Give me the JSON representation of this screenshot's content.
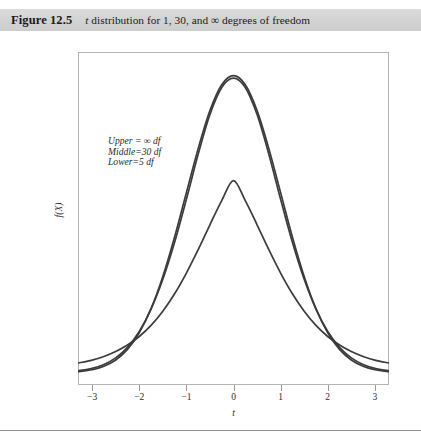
{
  "header": {
    "figure_number": "Figure 12.5",
    "caption_prefix": "t",
    "caption_rest": " distribution for 1, 30, and ∞ degrees of freedom"
  },
  "annotation": {
    "line1": "Upper = ∞ df",
    "line2": "Middle=30 df",
    "line3": "Lower=5 df"
  },
  "axes": {
    "x_title": "t",
    "y_title": "f(X)",
    "x_ticks": [
      "−3",
      "−2",
      "−1",
      "0",
      "1",
      "2",
      "3"
    ]
  },
  "colors": {
    "header_band": "#d2d2d2",
    "curve": "#3c3c3c",
    "frame": "#b4b4b4",
    "footer_rule": "#8e8e8e"
  },
  "chart_data": {
    "type": "line",
    "title": "t distribution for 1, 30, and ∞ degrees of freedom",
    "xlabel": "t",
    "ylabel": "f(X)",
    "xlim": [
      -3.3,
      3.3
    ],
    "ylim": [
      0,
      0.42
    ],
    "grid": false,
    "legend": "annotation-inside-plot",
    "x_ticks": [
      -3,
      -2,
      -1,
      0,
      1,
      2,
      3
    ],
    "series": [
      {
        "name": "Upper = ∞ df",
        "df": "infinity",
        "peak_value": 0.399,
        "x": [
          -3.3,
          -3,
          -2.75,
          -2.5,
          -2.25,
          -2,
          -1.75,
          -1.5,
          -1.25,
          -1,
          -0.75,
          -0.5,
          -0.25,
          0,
          0.25,
          0.5,
          0.75,
          1,
          1.25,
          1.5,
          1.75,
          2,
          2.25,
          2.5,
          2.75,
          3,
          3.3
        ],
        "values": [
          0.0017,
          0.0044,
          0.0091,
          0.0175,
          0.0317,
          0.054,
          0.0863,
          0.1295,
          0.1826,
          0.242,
          0.3011,
          0.3521,
          0.3867,
          0.3989,
          0.3867,
          0.3521,
          0.3011,
          0.242,
          0.1826,
          0.1295,
          0.0863,
          0.054,
          0.0317,
          0.0175,
          0.0091,
          0.0044,
          0.0017
        ]
      },
      {
        "name": "Middle=30 df",
        "df": 30,
        "peak_value": 0.3956,
        "x": [
          -3.3,
          -3,
          -2.75,
          -2.5,
          -2.25,
          -2,
          -1.75,
          -1.5,
          -1.25,
          -1,
          -0.75,
          -0.5,
          -0.25,
          0,
          0.25,
          0.5,
          0.75,
          1,
          1.25,
          1.5,
          1.75,
          2,
          2.25,
          2.5,
          2.75,
          3,
          3.3
        ],
        "values": [
          0.0029,
          0.0063,
          0.0115,
          0.0203,
          0.0344,
          0.0556,
          0.0857,
          0.1257,
          0.1754,
          0.2331,
          0.2934,
          0.3468,
          0.3831,
          0.3956,
          0.3831,
          0.3468,
          0.2934,
          0.2331,
          0.1754,
          0.1257,
          0.0857,
          0.0556,
          0.0344,
          0.0203,
          0.0115,
          0.0063,
          0.0029
        ]
      },
      {
        "name": "Lower=5 df",
        "df": 5,
        "peak_value": 0.3796,
        "x": [
          -3.3,
          -3,
          -2.75,
          -2.5,
          -2.25,
          -2,
          -1.75,
          -1.5,
          -1.25,
          -1,
          -0.75,
          -0.5,
          -0.25,
          0,
          0.25,
          0.5,
          0.75,
          1,
          1.25,
          1.5,
          1.75,
          2,
          2.25,
          2.5,
          2.75,
          3,
          3.3
        ],
        "values": [
          0.0133,
          0.0173,
          0.0222,
          0.0288,
          0.0375,
          0.049,
          0.0639,
          0.0829,
          0.1063,
          0.1341,
          0.1655,
          0.1989,
          0.2312,
          0.2581,
          0.2312,
          0.1989,
          0.1655,
          0.1341,
          0.1063,
          0.0829,
          0.0639,
          0.049,
          0.0375,
          0.0288,
          0.0222,
          0.0173,
          0.0133
        ]
      }
    ]
  }
}
